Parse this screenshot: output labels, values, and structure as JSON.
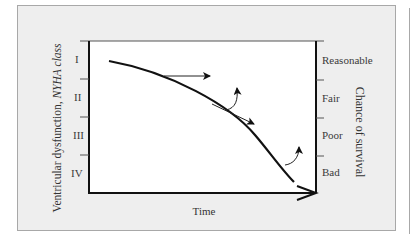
{
  "diagram": {
    "left_axis": {
      "title_prefix": "Ventricular dysfunction, ",
      "title_italic": "NYHA class",
      "ticks": [
        "I",
        "II",
        "III",
        "IV"
      ]
    },
    "right_axis": {
      "title": "Chance of survival",
      "ticks": [
        "Reasonable",
        "Fair",
        "Poor",
        "Bad"
      ]
    },
    "x_axis": {
      "title": "Time"
    },
    "colors": {
      "panel": "#eeeeee",
      "plot": "#ffffff",
      "line": "#111111",
      "text": "#333333"
    }
  }
}
